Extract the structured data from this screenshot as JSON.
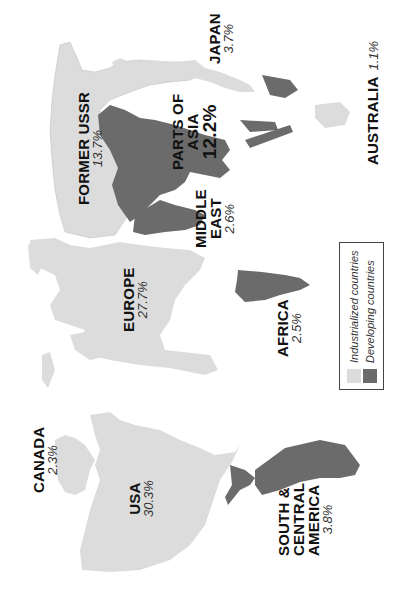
{
  "map": {
    "subject": "Cartogram of regions scaled by share",
    "colors": {
      "industrialized": "#dcdcdc",
      "developing": "#6b6b6b",
      "outline": "#444444",
      "background": "#ffffff"
    },
    "regions": [
      {
        "name": "CANADA",
        "value": "2.3%",
        "category": "industrialized"
      },
      {
        "name": "USA",
        "value": "30.3%",
        "category": "industrialized"
      },
      {
        "name": "SOUTH & CENTRAL AMERICA",
        "name_lines": [
          "SOUTH &",
          "CENTRAL",
          "AMERICA"
        ],
        "value": "3.8%",
        "category": "developing"
      },
      {
        "name": "EUROPE",
        "value": "27.7%",
        "category": "industrialized"
      },
      {
        "name": "AFRICA",
        "value": "2.5%",
        "category": "developing"
      },
      {
        "name": "FORMER USSR",
        "value": "13.7%",
        "category": "industrialized"
      },
      {
        "name": "MIDDLE EAST",
        "name_lines": [
          "MIDDLE",
          "EAST"
        ],
        "value": "2.6%",
        "category": "developing"
      },
      {
        "name": "PARTS OF ASIA",
        "name_lines": [
          "PARTS OF",
          "ASIA"
        ],
        "value": "12.2%",
        "category": "developing"
      },
      {
        "name": "JAPAN",
        "value": "3.7%",
        "category": "industrialized"
      },
      {
        "name": "AUSTRALIA",
        "value": "1.1%",
        "category": "industrialized"
      }
    ]
  },
  "legend": {
    "items": [
      {
        "label": "Industrialized countries",
        "color": "#dcdcdc"
      },
      {
        "label": "Developing countries",
        "color": "#6b6b6b"
      }
    ]
  }
}
